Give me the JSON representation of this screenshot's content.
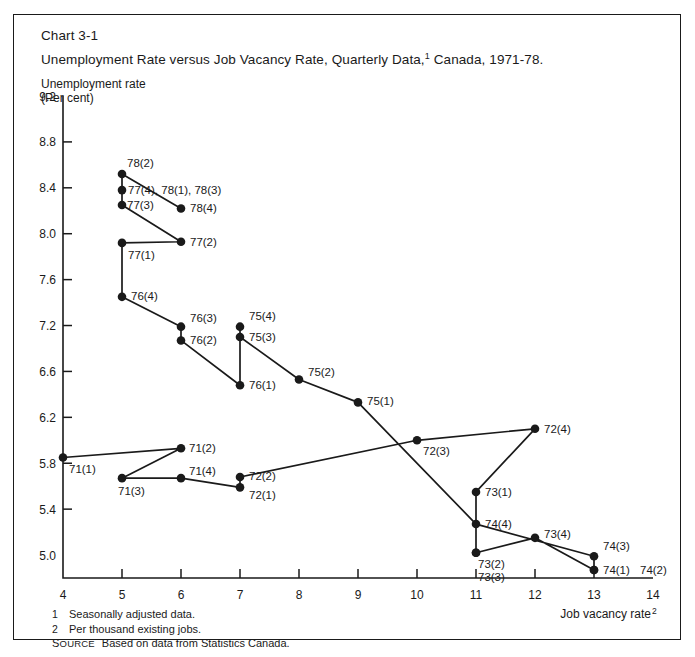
{
  "frame": {
    "chart_number": "Chart 3-1",
    "title": "Unemployment Rate versus Job Vacancy Rate, Quarterly Data,",
    "title_superscript": "1",
    "title_tail": " Canada, 1971-78.",
    "y_axis_caption_line1": "Unemployment rate",
    "y_axis_caption_line2": "(Per cent)",
    "x_axis_caption": "Job vacancy rate",
    "x_axis_caption_superscript": "2"
  },
  "footnotes": {
    "items": [
      {
        "marker": "1",
        "text": "Seasonally adjusted data."
      },
      {
        "marker": "2",
        "text": "Per thousand existing jobs."
      }
    ],
    "source_label_first": "S",
    "source_label_rest": "OURCE",
    "source_text": "Based on data from Statistics Canada."
  },
  "chart_data": {
    "type": "scatter",
    "xlabel": "Job vacancy rate",
    "ylabel": "Unemployment rate (Per cent)",
    "xlim": [
      4,
      14
    ],
    "ylim": [
      5.0,
      9.2
    ],
    "grid": false,
    "legend": "none",
    "connected": true,
    "x_ticks": [
      "4",
      "5",
      "6",
      "7",
      "8",
      "9",
      "10",
      "11",
      "12",
      "13",
      "14"
    ],
    "x_tick_values": [
      4,
      5,
      6,
      7,
      8,
      9,
      10,
      11,
      12,
      13,
      14
    ],
    "y_ticks": [
      "9.2",
      "8.8",
      "8.4",
      "8.0",
      "7.6",
      "7.2",
      "6.6",
      "6.2",
      "5.8",
      "5.4",
      "5.0"
    ],
    "y_tick_positions": [
      9.2,
      8.8,
      8.4,
      8.0,
      7.6,
      7.2,
      6.8,
      6.4,
      6.0,
      5.6,
      5.2
    ],
    "points": [
      {
        "label": "71(1)",
        "x": 4,
        "y": 6.05,
        "label_dx": 6,
        "label_dy": 15,
        "anchor": "start"
      },
      {
        "label": "71(2)",
        "x": 6,
        "y": 6.13,
        "label_dx": 8,
        "label_dy": 4,
        "anchor": "start"
      },
      {
        "label": "71(3)",
        "x": 5,
        "y": 5.87,
        "label_dx": -4,
        "label_dy": 17,
        "anchor": "start"
      },
      {
        "label": "71(4)",
        "x": 6,
        "y": 5.87,
        "label_dx": 8,
        "label_dy": -3,
        "anchor": "start"
      },
      {
        "label": "72(1)",
        "x": 7,
        "y": 5.79,
        "label_dx": 9,
        "label_dy": 12,
        "anchor": "start"
      },
      {
        "label": "72(2)",
        "x": 7,
        "y": 5.88,
        "label_dx": 9,
        "label_dy": 3,
        "anchor": "start"
      },
      {
        "label": "72(3)",
        "x": 10,
        "y": 6.2,
        "label_dx": 6,
        "label_dy": 15,
        "anchor": "start"
      },
      {
        "label": "72(4)",
        "x": 12,
        "y": 6.3,
        "label_dx": 9,
        "label_dy": 4,
        "anchor": "start"
      },
      {
        "label": "73(1)",
        "x": 11,
        "y": 5.75,
        "label_dx": 9,
        "label_dy": 4,
        "anchor": "start"
      },
      {
        "label": "73(2)",
        "x": 11,
        "y": 5.22,
        "label_dx": 2,
        "label_dy": 15,
        "anchor": "start"
      },
      {
        "label": "73(3)",
        "x": 11,
        "y": 5.22,
        "label_dx": 2,
        "label_dy": 28,
        "anchor": "start"
      },
      {
        "label": "73(4)",
        "x": 12,
        "y": 5.35,
        "label_dx": 9,
        "label_dy": 0,
        "anchor": "start"
      },
      {
        "label": "74(1)",
        "x": 13,
        "y": 5.07,
        "label_dx": 9,
        "label_dy": 4,
        "anchor": "start"
      },
      {
        "label": "74(2)",
        "x": 13,
        "y": 5.07,
        "label_dx": 46,
        "label_dy": 4,
        "anchor": "start"
      },
      {
        "label": "74(3)",
        "x": 13,
        "y": 5.19,
        "label_dx": 9,
        "label_dy": -6,
        "anchor": "start"
      },
      {
        "label": "74(4)",
        "x": 11,
        "y": 5.47,
        "label_dx": 9,
        "label_dy": 4,
        "anchor": "start"
      },
      {
        "label": "75(1)",
        "x": 9,
        "y": 6.53,
        "label_dx": 9,
        "label_dy": 3,
        "anchor": "start"
      },
      {
        "label": "75(2)",
        "x": 8,
        "y": 6.73,
        "label_dx": 9,
        "label_dy": -3,
        "anchor": "start"
      },
      {
        "label": "75(3)",
        "x": 7,
        "y": 7.1,
        "label_dx": 9,
        "label_dy": 4,
        "anchor": "start"
      },
      {
        "label": "75(4)",
        "x": 7,
        "y": 7.19,
        "label_dx": 9,
        "label_dy": -7,
        "anchor": "start"
      },
      {
        "label": "76(1)",
        "x": 7,
        "y": 6.68,
        "label_dx": 9,
        "label_dy": 4,
        "anchor": "start"
      },
      {
        "label": "76(2)",
        "x": 6,
        "y": 7.07,
        "label_dx": 9,
        "label_dy": 4,
        "anchor": "start"
      },
      {
        "label": "76(3)",
        "x": 6,
        "y": 7.19,
        "label_dx": 9,
        "label_dy": -5,
        "anchor": "start"
      },
      {
        "label": "76(4)",
        "x": 5,
        "y": 7.45,
        "label_dx": 9,
        "label_dy": 3,
        "anchor": "start"
      },
      {
        "label": "77(1)",
        "x": 5,
        "y": 7.92,
        "label_dx": 6,
        "label_dy": 16,
        "anchor": "start"
      },
      {
        "label": "77(2)",
        "x": 6,
        "y": 7.93,
        "label_dx": 9,
        "label_dy": 4,
        "anchor": "start"
      },
      {
        "label": "77(3)",
        "x": 5,
        "y": 8.25,
        "label_dx": 5,
        "label_dy": 4,
        "anchor": "start"
      },
      {
        "label": "77(4), 78(1), 78(3)",
        "x": 5,
        "y": 8.38,
        "label_dx": 6,
        "label_dy": 4,
        "anchor": "start"
      },
      {
        "label": "78(2)",
        "x": 5,
        "y": 8.52,
        "label_dx": 5,
        "label_dy": -7,
        "anchor": "start"
      },
      {
        "label": "78(4)",
        "x": 6,
        "y": 8.22,
        "label_dx": 9,
        "label_dy": 4,
        "anchor": "start"
      }
    ],
    "path_order": [
      "71(1)",
      "71(2)",
      "71(3)",
      "71(4)",
      "72(1)",
      "72(2)",
      "72(3)",
      "72(4)",
      "73(1)",
      "73(2)",
      "73(3)",
      "73(4)",
      "74(1)",
      "74(2)",
      "74(3)",
      "74(4)",
      "75(1)",
      "75(2)",
      "75(3)",
      "75(4)",
      "76(1)",
      "76(2)",
      "76(3)",
      "76(4)",
      "77(1)",
      "77(2)",
      "77(3)",
      "77(4), 78(1), 78(3)",
      "78(2)",
      "78(4)"
    ],
    "colors": {
      "marker": "#1a1a1a",
      "line": "#1a1a1a",
      "axis": "#1a1a1a"
    }
  }
}
